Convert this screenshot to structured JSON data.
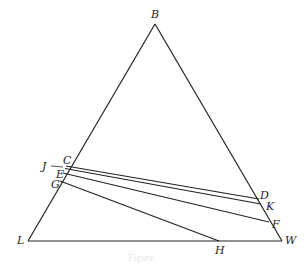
{
  "diagram": {
    "type": "triangle-construction",
    "points": {
      "B": {
        "label": "B",
        "x": 155,
        "y": 24
      },
      "L": {
        "label": "L",
        "x": 28,
        "y": 241
      },
      "W": {
        "label": "W",
        "x": 282,
        "y": 241
      },
      "C": {
        "label": "C",
        "x": 66,
        "y": 166
      },
      "J": {
        "label": "J",
        "x": 58,
        "y": 167
      },
      "E": {
        "label": "E",
        "x": 63,
        "y": 172
      },
      "G": {
        "label": "G",
        "x": 60,
        "y": 181
      },
      "D": {
        "label": "D",
        "x": 259,
        "y": 199
      },
      "K": {
        "label": "K",
        "x": 261,
        "y": 205
      },
      "F": {
        "label": "F",
        "x": 269,
        "y": 222
      },
      "H": {
        "label": "H",
        "x": 219,
        "y": 241
      }
    },
    "segments": [
      {
        "from": "B",
        "to": "L"
      },
      {
        "from": "B",
        "to": "W"
      },
      {
        "from": "L",
        "to": "W"
      },
      {
        "from": "C",
        "to": "D"
      },
      {
        "from": "J",
        "to": "K"
      },
      {
        "from": "E",
        "to": "F"
      },
      {
        "from": "G",
        "to": "H"
      }
    ],
    "caption": "Figure"
  }
}
